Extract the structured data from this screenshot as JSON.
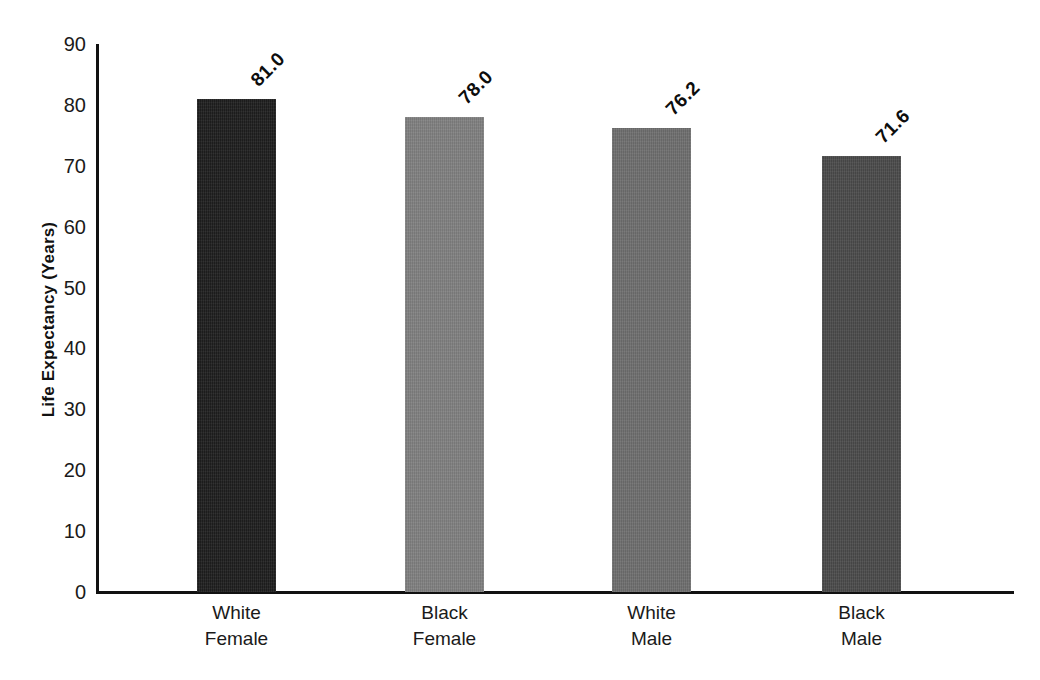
{
  "chart_data": {
    "type": "bar",
    "title": "",
    "xlabel": "",
    "ylabel": "Life Expectancy (Years)",
    "ylim": [
      0,
      90
    ],
    "ytick_step": 10,
    "yticks": [
      "90",
      "80",
      "70",
      "60",
      "50",
      "40",
      "30",
      "20",
      "10",
      "0"
    ],
    "grid": false,
    "legend": "none",
    "categories": [
      {
        "line1": "White",
        "line2": "Female"
      },
      {
        "line1": "Black",
        "line2": "Female"
      },
      {
        "line1": "White",
        "line2": "Male"
      },
      {
        "line1": "Black",
        "line2": "Male"
      }
    ],
    "category_labels": [
      "White Female",
      "Black Female",
      "White Male",
      "Black Male"
    ],
    "values": [
      81.0,
      78.0,
      76.2,
      71.6
    ],
    "value_labels": [
      "81.0",
      "78.0",
      "76.2",
      "71.6"
    ],
    "bar_colors": [
      "#1e1e1e",
      "#808080",
      "#6e6e6e",
      "#4a4a4a"
    ],
    "axis_color": "#111111",
    "background_color": "#ffffff"
  }
}
